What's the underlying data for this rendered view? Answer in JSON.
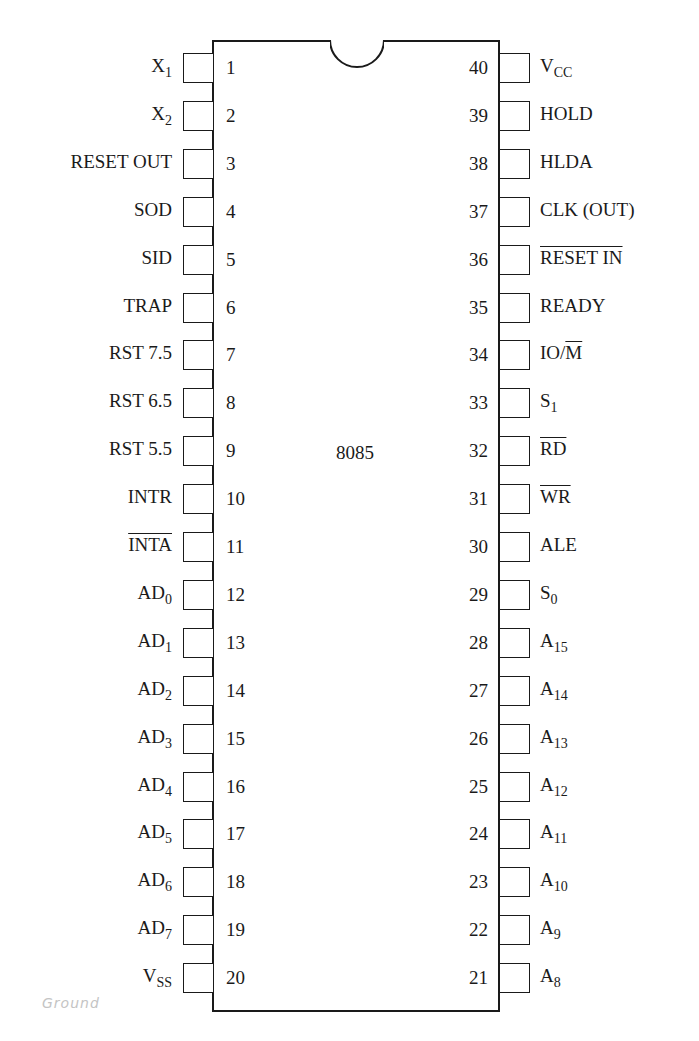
{
  "chip": {
    "name": "8085",
    "package": "40-pin DIP",
    "left_pins": [
      {
        "num": "1",
        "label": "X",
        "sub": "1",
        "overline": false
      },
      {
        "num": "2",
        "label": "X",
        "sub": "2",
        "overline": false
      },
      {
        "num": "3",
        "label": "RESET OUT",
        "sub": "",
        "overline": false
      },
      {
        "num": "4",
        "label": "SOD",
        "sub": "",
        "overline": false
      },
      {
        "num": "5",
        "label": "SID",
        "sub": "",
        "overline": false
      },
      {
        "num": "6",
        "label": "TRAP",
        "sub": "",
        "overline": false
      },
      {
        "num": "7",
        "label": "RST 7.5",
        "sub": "",
        "overline": false
      },
      {
        "num": "8",
        "label": "RST 6.5",
        "sub": "",
        "overline": false
      },
      {
        "num": "9",
        "label": "RST 5.5",
        "sub": "",
        "overline": false
      },
      {
        "num": "10",
        "label": "INTR",
        "sub": "",
        "overline": false
      },
      {
        "num": "11",
        "label": "INTA",
        "sub": "",
        "overline": true
      },
      {
        "num": "12",
        "label": "AD",
        "sub": "0",
        "overline": false
      },
      {
        "num": "13",
        "label": "AD",
        "sub": "1",
        "overline": false
      },
      {
        "num": "14",
        "label": "AD",
        "sub": "2",
        "overline": false
      },
      {
        "num": "15",
        "label": "AD",
        "sub": "3",
        "overline": false
      },
      {
        "num": "16",
        "label": "AD",
        "sub": "4",
        "overline": false
      },
      {
        "num": "17",
        "label": "AD",
        "sub": "5",
        "overline": false
      },
      {
        "num": "18",
        "label": "AD",
        "sub": "6",
        "overline": false
      },
      {
        "num": "19",
        "label": "AD",
        "sub": "7",
        "overline": false
      },
      {
        "num": "20",
        "label": "V",
        "sub": "SS",
        "overline": false
      }
    ],
    "right_pins": [
      {
        "num": "40",
        "label": "V",
        "sub": "CC",
        "overline": false
      },
      {
        "num": "39",
        "label": "HOLD",
        "sub": "",
        "overline": false
      },
      {
        "num": "38",
        "label": "HLDA",
        "sub": "",
        "overline": false
      },
      {
        "num": "37",
        "label": "CLK (OUT)",
        "sub": "",
        "overline": false
      },
      {
        "num": "36",
        "label": "RESET IN",
        "sub": "",
        "overline": true
      },
      {
        "num": "35",
        "label": "READY",
        "sub": "",
        "overline": false
      },
      {
        "num": "34",
        "label": "IO/",
        "sub": "",
        "overline": false,
        "suffix_overline": "M"
      },
      {
        "num": "33",
        "label": "S",
        "sub": "1",
        "overline": false
      },
      {
        "num": "32",
        "label": "RD",
        "sub": "",
        "overline": true
      },
      {
        "num": "31",
        "label": "WR",
        "sub": "",
        "overline": true
      },
      {
        "num": "30",
        "label": "ALE",
        "sub": "",
        "overline": false
      },
      {
        "num": "29",
        "label": "S",
        "sub": "0",
        "overline": false
      },
      {
        "num": "28",
        "label": "A",
        "sub": "15",
        "overline": false
      },
      {
        "num": "27",
        "label": "A",
        "sub": "14",
        "overline": false
      },
      {
        "num": "26",
        "label": "A",
        "sub": "13",
        "overline": false
      },
      {
        "num": "25",
        "label": "A",
        "sub": "12",
        "overline": false
      },
      {
        "num": "24",
        "label": "A",
        "sub": "11",
        "overline": false
      },
      {
        "num": "23",
        "label": "A",
        "sub": "10",
        "overline": false
      },
      {
        "num": "22",
        "label": "A",
        "sub": "9",
        "overline": false
      },
      {
        "num": "21",
        "label": "A",
        "sub": "8",
        "overline": false
      }
    ]
  },
  "annotation": {
    "handwritten_note": "Ground"
  },
  "colors": {
    "ink": "#1a1a1a",
    "background": "#ffffff",
    "pencil": "#c4c4c4"
  }
}
